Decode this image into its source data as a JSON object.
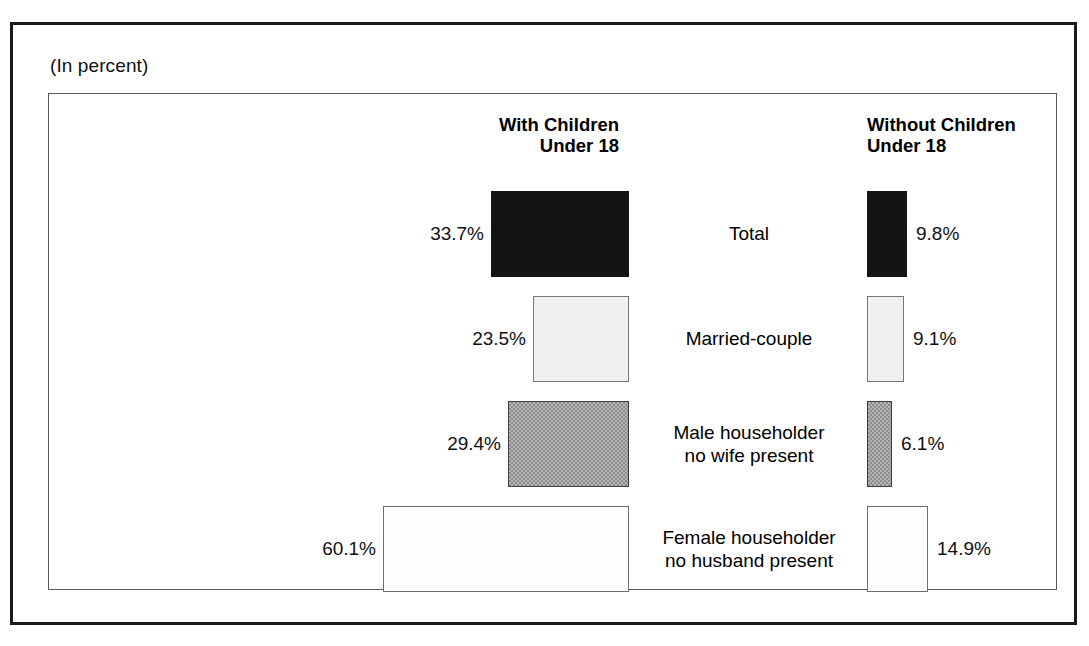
{
  "caption": "(In percent)",
  "headers": {
    "left": "With Children\nUnder 18",
    "right": "Without Children\nUnder 18"
  },
  "chart_data": {
    "type": "bar",
    "title": "",
    "subtitle": "(In percent)",
    "xlabel": "",
    "ylabel": "",
    "orientation": "horizontal",
    "layout": "bidirectional-tornado",
    "grid": false,
    "legend_position": "none",
    "unit": "percent",
    "categories": [
      "Total",
      "Married-couple",
      "Male householder\nno wife present",
      "Female householder\nno husband present"
    ],
    "series": [
      {
        "name": "With Children Under 18",
        "side": "left",
        "values": [
          33.7,
          23.5,
          29.4,
          60.1
        ],
        "labels": [
          "33.7%",
          "23.5%",
          "29.4%",
          "60.1%"
        ]
      },
      {
        "name": "Without Children Under 18",
        "side": "right",
        "values": [
          9.8,
          9.1,
          6.1,
          14.9
        ],
        "labels": [
          "9.8%",
          "9.1%",
          "6.1%",
          "14.9%"
        ]
      }
    ],
    "bar_fills": [
      "solid-black",
      "pale-gray",
      "mid-gray",
      "white"
    ],
    "colors": {
      "solid-black": "#141414",
      "pale-gray": "#efefef",
      "mid-gray": "#b4b4b4",
      "white": "#fdfdfd",
      "outline": "#5a5a5a",
      "frame": "#1a1a1a",
      "text": "#000000"
    },
    "xlim": [
      0,
      60.1
    ],
    "px_per_percent": 4.1
  }
}
